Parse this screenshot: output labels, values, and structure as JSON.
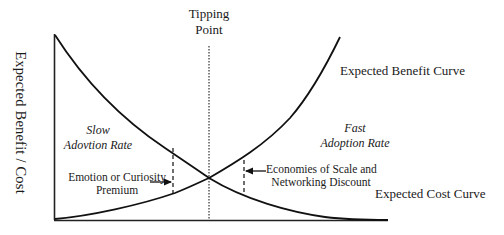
{
  "diagram": {
    "type": "concept curve diagram",
    "y_axis_label": "Expected Benefit / Cost",
    "tipping_point": {
      "line1": "Tipping",
      "line2": "Point"
    },
    "curves": [
      {
        "name": "Expected Benefit Curve",
        "shape": "rising (convex)"
      },
      {
        "name": "Expected Cost Curve",
        "shape": "falling (convex)"
      }
    ],
    "regions": {
      "left": {
        "line1": "Slow",
        "line2": "Adovtion Rate"
      },
      "right": {
        "line1": "Fast",
        "line2": "Adoption Rate"
      }
    },
    "annotations": {
      "left_gap": {
        "line1": "Emotion or Curiosity",
        "line2": "Premium"
      },
      "right_gap": {
        "line1": "Economies of Scale and",
        "line2": "Networking Discount"
      }
    },
    "colors": {
      "line": "#111111",
      "background": "#ffffff"
    }
  }
}
